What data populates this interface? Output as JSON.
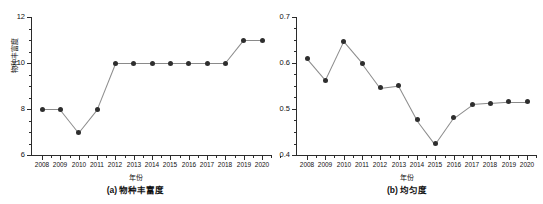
{
  "figure": {
    "background": "#ffffff",
    "marker_color": "#2e2e2e",
    "line_color": "#8a8a8a",
    "axis_color": "#2b2b2b"
  },
  "chart_data": [
    {
      "type": "line",
      "panel": "a",
      "title": "(a) 物种丰富度",
      "xlabel": "年份",
      "ylabel": "物种丰富度",
      "categories": [
        "2008",
        "2009",
        "2010",
        "2011",
        "2012",
        "2013",
        "2014",
        "2015",
        "2016",
        "2017",
        "2018",
        "2019",
        "2020"
      ],
      "values": [
        8,
        8,
        7,
        8,
        10,
        10,
        10,
        10,
        10,
        10,
        10,
        11,
        11
      ],
      "ylim": [
        6,
        12
      ],
      "yticks": [
        6,
        8,
        10,
        12
      ],
      "ytick_labels": [
        "6",
        "8",
        "10",
        "12"
      ],
      "minor_ytick_step": 0.5,
      "grid": false,
      "legend": "none",
      "markers": "filled-circle"
    },
    {
      "type": "line",
      "panel": "b",
      "title": "(b) 均匀度",
      "xlabel": "年份",
      "ylabel": "均匀度",
      "categories": [
        "2008",
        "2009",
        "2010",
        "2011",
        "2012",
        "2013",
        "2014",
        "2015",
        "2016",
        "2017",
        "2018",
        "2019",
        "2020"
      ],
      "values": [
        0.61,
        0.563,
        0.647,
        0.6,
        0.546,
        0.551,
        0.477,
        0.424,
        0.481,
        0.51,
        0.513,
        0.516,
        0.516
      ],
      "ylim": [
        0.4,
        0.7
      ],
      "yticks": [
        0.4,
        0.5,
        0.6,
        0.7
      ],
      "ytick_labels": [
        "0.4",
        "0.5",
        "0.6",
        "0.7"
      ],
      "minor_ytick_step": 0.025,
      "grid": false,
      "legend": "none",
      "markers": "filled-circle"
    }
  ]
}
